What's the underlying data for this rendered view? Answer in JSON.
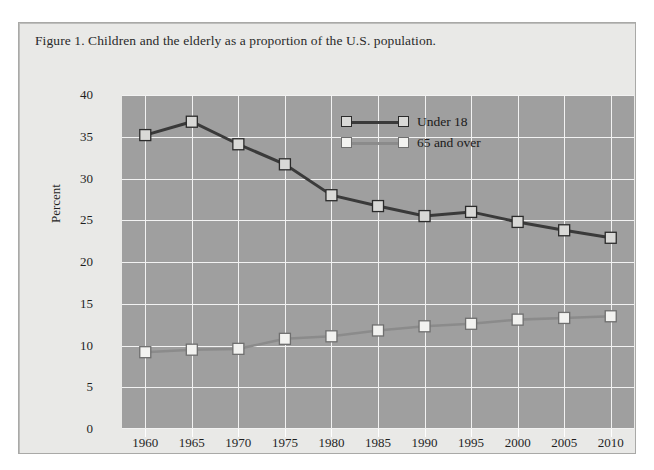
{
  "page": {
    "top_cut_text": "",
    "background_color": "#ffffff"
  },
  "figure": {
    "caption": "Figure 1. Children and the elderly as a proportion of the U.S. population.",
    "frame_color": "#a9a9a7",
    "panel_color": "#e9e9e7"
  },
  "chart_data": {
    "type": "line",
    "title": "Figure 1. Children and the elderly as a proportion of the U.S. population.",
    "xlabel": "",
    "ylabel": "Percent",
    "categories": [
      "1960",
      "1965",
      "1970",
      "1975",
      "1980",
      "1985",
      "1990",
      "1995",
      "2000",
      "2005",
      "2010"
    ],
    "x": [
      1960,
      1965,
      1970,
      1975,
      1980,
      1985,
      1990,
      1995,
      2000,
      2005,
      2010
    ],
    "series": [
      {
        "name": "Under 18",
        "color": "#3a3a3a",
        "marker": "square",
        "marker_fill": "#d9d9d7",
        "values": [
          35.2,
          36.8,
          34.1,
          31.7,
          28.0,
          26.7,
          25.5,
          26.0,
          24.8,
          23.8,
          22.9
        ]
      },
      {
        "name": "65 and over",
        "color": "#8b8b8b",
        "marker": "square",
        "marker_fill": "#f2f2f0",
        "values": [
          9.2,
          9.5,
          9.6,
          10.8,
          11.1,
          11.8,
          12.3,
          12.6,
          13.1,
          13.3,
          13.5
        ]
      }
    ],
    "ylim": [
      0,
      40
    ],
    "yticks": [
      0,
      5,
      10,
      15,
      20,
      25,
      30,
      35,
      40
    ],
    "ytick_labels": [
      "0",
      "5",
      "10",
      "15",
      "20",
      "25",
      "30",
      "35",
      "40"
    ],
    "xtick_labels": [
      "1960",
      "1965",
      "1970",
      "1975",
      "1980",
      "1985",
      "1990",
      "1995",
      "2000",
      "2005",
      "2010"
    ],
    "grid": true,
    "grid_color": "#f2f2f2",
    "plot_background": "#9f9f9f",
    "legend_position": "upper-center",
    "legend_entries": [
      "Under 18",
      "65 and over"
    ]
  }
}
